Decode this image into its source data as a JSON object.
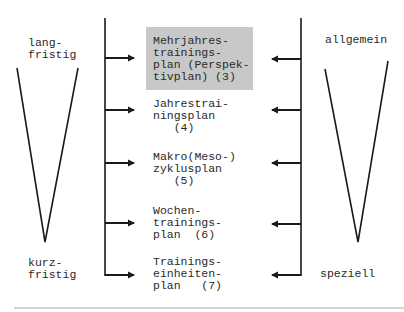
{
  "left_scale": {
    "top_label": "lang-\nfristig",
    "bottom_label": "kurz-\nfristig"
  },
  "right_scale": {
    "top_label": "allgemein",
    "bottom_label": "speziell"
  },
  "plans": [
    {
      "text": "Mehrjahres-\ntrainings-\nplan (Perspek-\ntivplan) (3)",
      "highlighted": true
    },
    {
      "text": "Jahrestrai-\nningsplan\n   (4)",
      "highlighted": false
    },
    {
      "text": "Makro(Meso-)\nzyklusplan\n   (5)",
      "highlighted": false
    },
    {
      "text": "Wochen-\ntrainings-\nplan  (6)",
      "highlighted": false
    },
    {
      "text": "Trainings-\neinheiten-\nplan   (7)",
      "highlighted": false
    }
  ],
  "colors": {
    "line": "#1a1a1a",
    "highlight": "#c8c8c8",
    "rule": "#d4d4d4"
  }
}
